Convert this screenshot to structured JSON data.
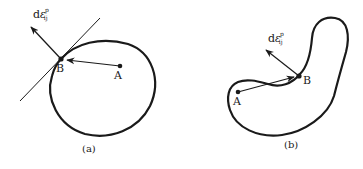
{
  "figure": {
    "panels": [
      {
        "id": "a",
        "caption": "(a)",
        "shape": "convex ellipse",
        "point_A": "A",
        "point_B": "B",
        "vector_label": {
          "d": "d",
          "eps": "ε",
          "sup": "p",
          "sub": "ij"
        },
        "has_tangent_line": true
      },
      {
        "id": "b",
        "caption": "(b)",
        "shape": "non-convex bean",
        "point_A": "A",
        "point_B": "B",
        "vector_label": {
          "d": "d",
          "eps": "ε",
          "sup": "p",
          "sub": "ij"
        },
        "has_tangent_line": false
      }
    ],
    "colors": {
      "stroke": "#1a1a1a",
      "background": "#ffffff"
    }
  }
}
